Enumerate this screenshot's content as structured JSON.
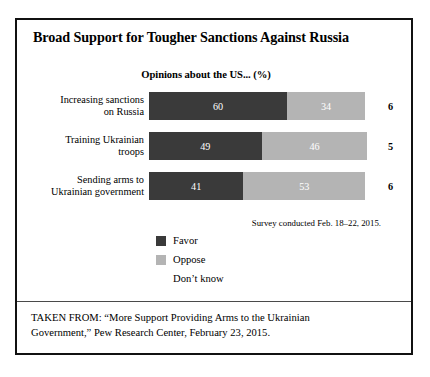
{
  "figure": {
    "title": "Broad Support for Tougher Sanctions Against Russia",
    "subtitle": "Opinions about the US... (%)",
    "survey_note": "Survey conducted Feb. 18–22, 2015.",
    "source_line_1": "TAKEN FROM: “More Support Providing Arms to the Ukrainian",
    "source_line_2": "Government,” Pew Research Center, February 23, 2015."
  },
  "colors": {
    "favor": "#3a3a3a",
    "oppose": "#b4b4b4",
    "dont_know": "#ffffff",
    "border": "#111111",
    "text": "#000000",
    "value_text": "#ffffff"
  },
  "rows": [
    {
      "label_line_1": "Increasing sanctions",
      "label_line_2": "on Russia",
      "favor": 60,
      "oppose": 34,
      "dont_know": 6
    },
    {
      "label_line_1": "Training Ukrainian",
      "label_line_2": "troops",
      "favor": 49,
      "oppose": 46,
      "dont_know": 5
    },
    {
      "label_line_1": "Sending arms to",
      "label_line_2": "Ukrainian government",
      "favor": 41,
      "oppose": 53,
      "dont_know": 6
    }
  ],
  "legend": {
    "items": [
      {
        "label": "Favor",
        "swatch": "favor-swatch-icon"
      },
      {
        "label": "Oppose",
        "swatch": "oppose-swatch-icon"
      },
      {
        "label": "Don’t know",
        "swatch": "dont-know-swatch-icon"
      }
    ]
  },
  "chart_data": {
    "type": "bar",
    "orientation": "horizontal",
    "stacked": true,
    "stacked_100": true,
    "title": "Broad Support for Tougher Sanctions Against Russia",
    "subtitle": "Opinions about the US... (%)",
    "xlabel": "",
    "ylabel": "",
    "xlim": [
      0,
      100
    ],
    "unit": "%",
    "grid": false,
    "legend_position": "bottom-left",
    "categories": [
      "Increasing sanctions on Russia",
      "Training Ukrainian troops",
      "Sending arms to Ukrainian government"
    ],
    "series": [
      {
        "name": "Favor",
        "values": [
          60,
          49,
          41
        ],
        "color": "#3a3a3a"
      },
      {
        "name": "Oppose",
        "values": [
          34,
          46,
          53
        ],
        "color": "#b4b4b4"
      },
      {
        "name": "Don’t know",
        "values": [
          6,
          5,
          6
        ],
        "color": "#ffffff"
      }
    ],
    "annotations": [
      "Survey conducted Feb. 18–22, 2015.",
      "TAKEN FROM: “More Support Providing Arms to the Ukrainian Government,” Pew Research Center, February 23, 2015."
    ]
  }
}
